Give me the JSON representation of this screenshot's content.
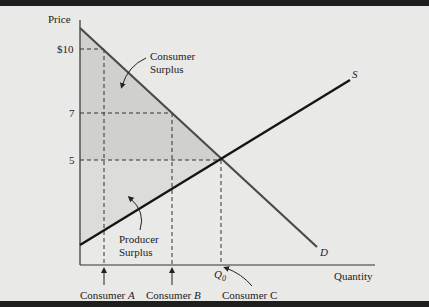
{
  "diagram": {
    "type": "supply-demand-surplus",
    "axes": {
      "y_label": "Price",
      "x_label": "Quantity",
      "y_ticks": [
        {
          "label": "$10",
          "value": 10
        },
        {
          "label": "7",
          "value": 7
        },
        {
          "label": "5",
          "value": 5
        }
      ]
    },
    "curves": {
      "demand_label": "D",
      "supply_label": "S"
    },
    "areas": {
      "consumer_surplus": {
        "line1": "Consumer",
        "line2": "Surplus"
      },
      "producer_surplus": {
        "line1": "Producer",
        "line2": "Surplus"
      }
    },
    "markers": {
      "q0_label": "Q",
      "q0_sub": "0",
      "consumer_a_prefix": "Consumer ",
      "consumer_a_letter": "A",
      "consumer_b_prefix": "Consumer ",
      "consumer_b_letter": "B",
      "consumer_c": "Consumer C"
    },
    "colors": {
      "background": "#e9e9e7",
      "frame": "#1e1e1e",
      "demand_line": "#4a4a4a",
      "supply_line": "#151515",
      "shading": "#cfcfcd",
      "axis": "#333333"
    }
  }
}
